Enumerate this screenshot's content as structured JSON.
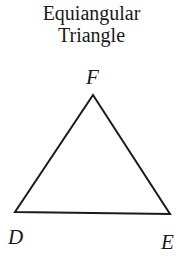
{
  "title": {
    "line1": "Equiangular",
    "line2": "Triangle"
  },
  "triangle": {
    "vertices": [
      {
        "label": "F",
        "x": 93,
        "y": 95
      },
      {
        "label": "D",
        "x": 15,
        "y": 212
      },
      {
        "label": "E",
        "x": 170,
        "y": 214
      }
    ],
    "stroke_color": "#1a1a1a"
  },
  "labels": {
    "top": "F",
    "left": "D",
    "right": "E"
  }
}
